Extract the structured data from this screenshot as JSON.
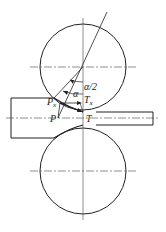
{
  "diagram": {
    "labels": {
      "half_angle": "α/2",
      "angle": "α",
      "tx_main": "T",
      "tx_sub": "x",
      "px_main": "P",
      "px_sub": "x",
      "p": "P",
      "t": "T"
    },
    "colors": {
      "line": "#222222",
      "background": "#ffffff"
    }
  }
}
